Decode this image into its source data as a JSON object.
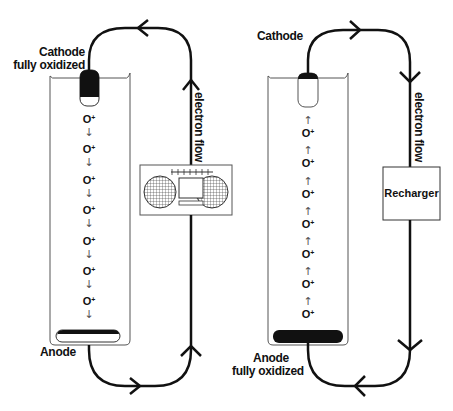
{
  "diagram": {
    "type": "battery-discharge-recharge",
    "panels": [
      {
        "id": "discharge",
        "cathode_label_line1": "Cathode",
        "cathode_label_line2": "fully oxidized",
        "anode_label_line1": "Anode",
        "anode_label_line2": "",
        "ion_label": "O",
        "ion_charge": "+",
        "ion_count": 7,
        "ion_direction": "down",
        "ion_arrow_glyph": "↓",
        "flow_label": "electron flow",
        "device": "boombox-icon",
        "electron_flow_direction": "anode-to-cathode"
      },
      {
        "id": "recharge",
        "cathode_label_line1": "Cathode",
        "cathode_label_line2": "",
        "anode_label_line1": "Anode",
        "anode_label_line2": "fully oxidized",
        "ion_label": "O",
        "ion_charge": "+",
        "ion_count": 7,
        "ion_direction": "up",
        "ion_arrow_glyph": "↑",
        "flow_label": "electron flow",
        "device_label": "Recharger",
        "electron_flow_direction": "cathode-to-anode"
      }
    ],
    "colors": {
      "line": "#111111",
      "container": "#555555",
      "background": "#ffffff"
    }
  }
}
